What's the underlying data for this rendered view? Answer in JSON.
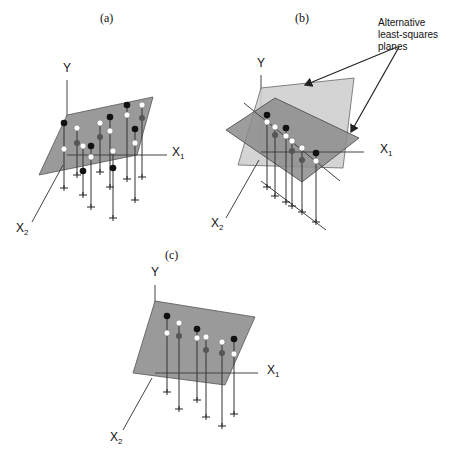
{
  "figure": {
    "panels": [
      {
        "id": "a",
        "caption": "(a)",
        "axis_y": "Y",
        "axis_x1": "X",
        "axis_x1_sub": "1",
        "axis_x2": "X",
        "axis_x2_sub": "2"
      },
      {
        "id": "b",
        "caption": "(b)",
        "axis_y": "Y",
        "axis_x1": "X",
        "axis_x1_sub": "1",
        "axis_x2": "X",
        "axis_x2_sub": "2"
      },
      {
        "id": "c",
        "caption": "(c)",
        "axis_y": "Y",
        "axis_x1": "X",
        "axis_x1_sub": "1",
        "axis_x2": "X",
        "axis_x2_sub": "2"
      }
    ],
    "annotation": {
      "line1": "Alternative",
      "line2": "least-squares",
      "line3": "planes"
    },
    "colors": {
      "plane_gray": "#9a9a9a",
      "plane_light": "#cfcfcf",
      "plane_dark": "#8c8c8c",
      "observed_point": "#111111",
      "fitted_point": "#ffffff",
      "hidden_point": "#555555"
    }
  }
}
